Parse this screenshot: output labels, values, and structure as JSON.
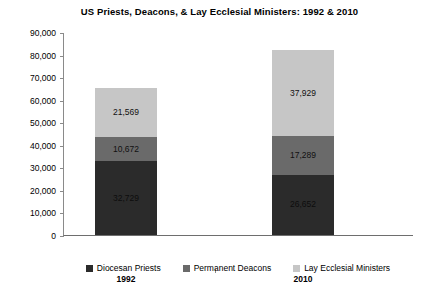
{
  "chart_data": {
    "type": "bar",
    "subtype": "stacked-bar",
    "title": "US Priests, Deacons, & Lay Ecclesial Ministers: 1992 & 2010",
    "xlabel": "",
    "ylabel": "",
    "categories": [
      "1992",
      "2010"
    ],
    "ylim": [
      0,
      90000
    ],
    "ytick_step": 10000,
    "ytick_labels": [
      "0",
      "10,000",
      "20,000",
      "30,000",
      "40,000",
      "50,000",
      "60,000",
      "70,000",
      "80,000",
      "90,000"
    ],
    "ytick_values": [
      0,
      10000,
      20000,
      30000,
      40000,
      50000,
      60000,
      70000,
      80000,
      90000
    ],
    "grid": false,
    "legend_position": "bottom",
    "series": [
      {
        "name": "Diocesan Priests",
        "color": "#2b2b2b",
        "values": [
          32729,
          26652
        ],
        "value_labels": [
          "32,729",
          "26,652"
        ]
      },
      {
        "name": "Permanent Deacons",
        "color": "#6a6a6a",
        "values": [
          10672,
          17289
        ],
        "value_labels": [
          "10,672",
          "17,289"
        ]
      },
      {
        "name": "Lay Ecclesial Ministers",
        "color": "#c6c6c6",
        "values": [
          21569,
          37929
        ],
        "value_labels": [
          "21,569",
          "37,929"
        ]
      }
    ],
    "totals": [
      64970,
      81870
    ]
  },
  "colors": {
    "background": "#ffffff",
    "axis": "#8a8a8a",
    "text": "#000000"
  }
}
